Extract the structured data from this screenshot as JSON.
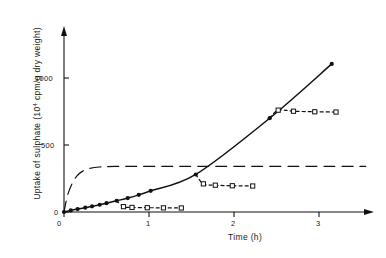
{
  "figure": {
    "background": "#ffffff",
    "ink": "#111111"
  },
  "axes": {
    "y": {
      "label_prefix": "Uptake of sulphate (10",
      "label_exponent": "4",
      "label_suffix": " cpm/g dry weight)",
      "ticks": [
        "0",
        "500",
        "1000"
      ],
      "tick_values": [
        0,
        500,
        1000
      ],
      "range": [
        0,
        1260
      ]
    },
    "x": {
      "label": "Time (h)",
      "ticks": [
        "0",
        "1",
        "2",
        "3"
      ],
      "tick_values": [
        0,
        1,
        2,
        3
      ],
      "range": [
        0,
        3.6
      ]
    }
  },
  "chart_data": {
    "type": "line",
    "title": "",
    "xlabel": "Time (h)",
    "ylabel": "Uptake of sulphate (10^4 cpm/g dry weight)",
    "xlim": [
      0,
      3.6
    ],
    "ylim": [
      0,
      1260
    ],
    "grid": false,
    "legend": "none",
    "series": [
      {
        "name": "continuous-uptake",
        "style": "solid-line-filled-circles",
        "marker": "filled-circle",
        "color": "#111111",
        "points": [
          {
            "x": 0.0,
            "y": 0
          },
          {
            "x": 0.08,
            "y": 12
          },
          {
            "x": 0.16,
            "y": 22
          },
          {
            "x": 0.25,
            "y": 32
          },
          {
            "x": 0.33,
            "y": 42
          },
          {
            "x": 0.42,
            "y": 54
          },
          {
            "x": 0.5,
            "y": 66
          },
          {
            "x": 0.62,
            "y": 84
          },
          {
            "x": 0.75,
            "y": 104
          },
          {
            "x": 0.88,
            "y": 128
          },
          {
            "x": 1.02,
            "y": 158
          },
          {
            "x": 1.55,
            "y": 280
          },
          {
            "x": 2.42,
            "y": 700
          },
          {
            "x": 3.15,
            "y": 1105
          }
        ]
      },
      {
        "name": "saturating-control",
        "style": "long-dashed-curve",
        "marker": "none",
        "color": "#111111",
        "points": [
          {
            "x": 0.0,
            "y": 0
          },
          {
            "x": 0.04,
            "y": 120
          },
          {
            "x": 0.09,
            "y": 205
          },
          {
            "x": 0.15,
            "y": 268
          },
          {
            "x": 0.22,
            "y": 305
          },
          {
            "x": 0.3,
            "y": 325
          },
          {
            "x": 0.42,
            "y": 336
          },
          {
            "x": 0.6,
            "y": 340
          },
          {
            "x": 1.2,
            "y": 341
          },
          {
            "x": 2.0,
            "y": 341
          },
          {
            "x": 3.0,
            "y": 341
          },
          {
            "x": 3.55,
            "y": 341
          }
        ],
        "plateau": 341
      },
      {
        "name": "chase-branch-early",
        "style": "short-dashed-open-squares",
        "marker": "open-square",
        "color": "#111111",
        "points": [
          {
            "x": 0.62,
            "y": 84
          },
          {
            "x": 0.7,
            "y": 40
          },
          {
            "x": 0.8,
            "y": 34
          },
          {
            "x": 0.98,
            "y": 32
          },
          {
            "x": 1.17,
            "y": 31
          },
          {
            "x": 1.38,
            "y": 30
          }
        ],
        "plateau": 30
      },
      {
        "name": "chase-branch-mid",
        "style": "short-dashed-open-squares",
        "marker": "open-square",
        "color": "#111111",
        "points": [
          {
            "x": 1.55,
            "y": 280
          },
          {
            "x": 1.64,
            "y": 210
          },
          {
            "x": 1.78,
            "y": 200
          },
          {
            "x": 1.98,
            "y": 196
          },
          {
            "x": 2.22,
            "y": 194
          }
        ],
        "plateau": 194
      },
      {
        "name": "chase-branch-late",
        "style": "short-dashed-open-squares",
        "marker": "open-square",
        "color": "#111111",
        "points": [
          {
            "x": 2.42,
            "y": 700
          },
          {
            "x": 2.52,
            "y": 760
          },
          {
            "x": 2.7,
            "y": 752
          },
          {
            "x": 2.95,
            "y": 748
          },
          {
            "x": 3.2,
            "y": 746
          }
        ],
        "plateau": 746
      }
    ]
  }
}
